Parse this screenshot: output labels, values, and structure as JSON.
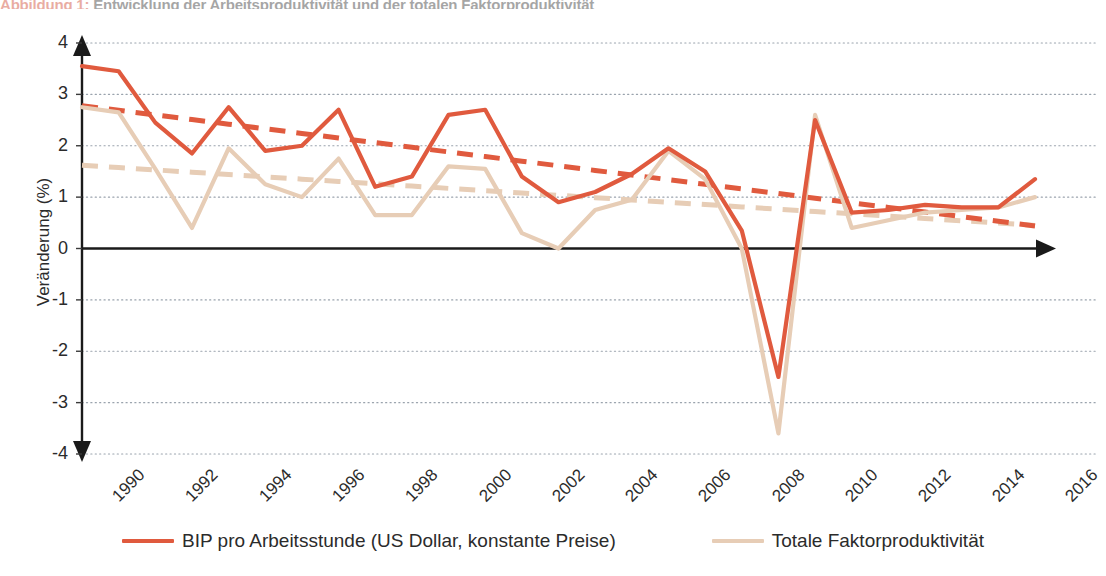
{
  "figure": {
    "caption_label": "Abbildung 1:",
    "caption_rest": " Entwicklung der Arbeitsproduktivität und der totalen Faktorproduktivität"
  },
  "legend": {
    "position": "bottom-center",
    "entries": [
      {
        "label": "BIP pro Arbeitsstunde (US Dollar, konstante Preise)",
        "color": "#e05a3e",
        "icon": "line-swatch-icon"
      },
      {
        "label": "Totale Faktorproduktivität",
        "color": "#e7cdb6",
        "icon": "line-swatch-icon"
      }
    ]
  },
  "axes": {
    "y_title": "Veränderung (%)",
    "y_ticks": [
      "4",
      "3",
      "2",
      "1",
      "0",
      "-1",
      "-2",
      "-3",
      "-4"
    ],
    "x_ticks": [
      "1990",
      "1992",
      "1994",
      "1996",
      "1998",
      "2000",
      "2002",
      "2004",
      "2006",
      "2008",
      "2010",
      "2012",
      "2014",
      "2016"
    ]
  },
  "chart_data": {
    "type": "line",
    "title": "Abbildung 1: Entwicklung der Arbeitsproduktivität und der totalen Faktorproduktivität",
    "xlabel": "",
    "ylabel": "Veränderung (%)",
    "ylim": [
      -4,
      4
    ],
    "xlim": [
      1990,
      2016
    ],
    "grid": true,
    "grid_axis": "y",
    "grid_style": "dotted",
    "legend_position": "bottom-center",
    "x": [
      1990,
      1991,
      1992,
      1993,
      1994,
      1995,
      1996,
      1997,
      1998,
      1999,
      2000,
      2001,
      2002,
      2003,
      2004,
      2005,
      2006,
      2007,
      2008,
      2009,
      2010,
      2011,
      2012,
      2013,
      2014,
      2015,
      2016
    ],
    "series": [
      {
        "name": "BIP pro Arbeitsstunde (US Dollar, konstante Preise)",
        "color": "#e05a3e",
        "style": "solid",
        "values": [
          3.55,
          3.45,
          2.45,
          1.85,
          2.75,
          1.9,
          2.0,
          2.7,
          1.2,
          1.4,
          2.6,
          2.7,
          1.4,
          0.9,
          1.1,
          1.45,
          1.95,
          1.5,
          0.35,
          -2.5,
          2.5,
          0.7,
          0.75,
          0.85,
          0.8,
          0.8,
          1.35
        ]
      },
      {
        "name": "BIP pro Arbeitsstunde — Trend",
        "color": "#e05a3e",
        "style": "dashed",
        "trendline_for": "BIP pro Arbeitsstunde (US Dollar, konstante Preise)",
        "values": [
          2.78,
          2.69,
          2.6,
          2.51,
          2.42,
          2.33,
          2.24,
          2.15,
          2.06,
          1.97,
          1.88,
          1.79,
          1.7,
          1.61,
          1.52,
          1.43,
          1.34,
          1.25,
          1.16,
          1.07,
          0.98,
          0.89,
          0.8,
          0.71,
          0.62,
          0.53,
          0.44
        ]
      },
      {
        "name": "Totale Faktorproduktivität",
        "color": "#e7cdb6",
        "style": "solid",
        "values": [
          2.75,
          2.65,
          1.55,
          0.4,
          1.95,
          1.25,
          1.0,
          1.75,
          0.65,
          0.65,
          1.6,
          1.55,
          0.3,
          0.0,
          0.75,
          0.95,
          1.9,
          1.35,
          0.0,
          -3.6,
          2.6,
          0.4,
          0.55,
          0.7,
          0.75,
          0.8,
          1.0
        ]
      },
      {
        "name": "Totale Faktorproduktivität — Trend",
        "color": "#e7cdb6",
        "style": "dashed",
        "trendline_for": "Totale Faktorproduktivität",
        "values": [
          1.62,
          1.575,
          1.53,
          1.485,
          1.44,
          1.395,
          1.35,
          1.305,
          1.26,
          1.215,
          1.17,
          1.125,
          1.08,
          1.035,
          0.99,
          0.945,
          0.9,
          0.855,
          0.81,
          0.765,
          0.72,
          0.675,
          0.63,
          0.585,
          0.54,
          0.495,
          0.45
        ]
      }
    ]
  }
}
